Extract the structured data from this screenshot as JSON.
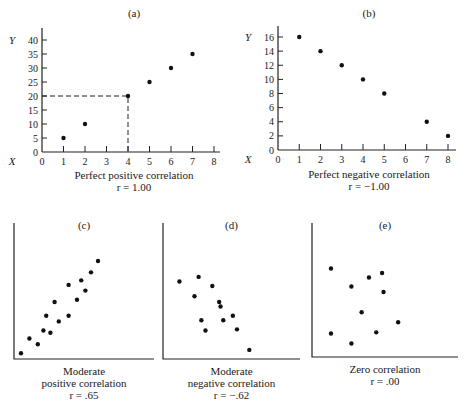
{
  "chart_data": [
    {
      "id": "a",
      "type": "scatter",
      "title": "(a)",
      "caption": "Perfect positive correlation",
      "r_label": "r = 1.00",
      "xlabel": "X",
      "ylabel": "Y",
      "xlim": [
        0,
        8
      ],
      "ylim": [
        0,
        40
      ],
      "xticks": [
        0,
        1,
        2,
        3,
        4,
        5,
        6,
        7,
        8
      ],
      "yticks": [
        0,
        5,
        10,
        15,
        20,
        25,
        30,
        35,
        40
      ],
      "x": [
        1,
        2,
        4,
        5,
        6,
        7
      ],
      "y": [
        5,
        10,
        20,
        25,
        30,
        35
      ],
      "annotation": {
        "type": "dashed-guide",
        "x": 4,
        "y": 20
      }
    },
    {
      "id": "b",
      "type": "scatter",
      "title": "(b)",
      "caption": "Perfect negative correlation",
      "r_label": "r = −1.00",
      "xlabel": "X",
      "ylabel": "Y",
      "xlim": [
        0,
        8
      ],
      "ylim": [
        0,
        16
      ],
      "xticks": [
        0,
        1,
        2,
        3,
        4,
        5,
        6,
        7,
        8
      ],
      "yticks": [
        0,
        2,
        4,
        6,
        8,
        10,
        12,
        14,
        16
      ],
      "x": [
        1,
        2,
        3,
        4,
        5,
        7,
        8
      ],
      "y": [
        16,
        14,
        12,
        10,
        8,
        4,
        2
      ]
    },
    {
      "id": "c",
      "type": "scatter",
      "title": "(c)",
      "caption": [
        "Moderate",
        "positive correlation"
      ],
      "r_label": "r = .65",
      "xlim": [
        0,
        10
      ],
      "ylim": [
        0,
        10
      ],
      "x": [
        0.5,
        1.1,
        1.7,
        2.1,
        2.6,
        2.3,
        3.2,
        2.9,
        3.9,
        3.9,
        4.5,
        4.8,
        5.1,
        5.5,
        6.0
      ],
      "y": [
        0.5,
        1.8,
        1.3,
        2.5,
        2.3,
        3.8,
        3.3,
        5.0,
        3.8,
        6.5,
        5.2,
        6.9,
        6.0,
        7.6,
        8.6
      ]
    },
    {
      "id": "d",
      "type": "scatter",
      "title": "(d)",
      "caption": [
        "Moderate",
        "negative correlation"
      ],
      "r_label": "r = −.62",
      "xlim": [
        0,
        10
      ],
      "ylim": [
        0,
        10
      ],
      "x": [
        1.2,
        2.3,
        2.8,
        3.1,
        3.6,
        4.1,
        4.2,
        4.4,
        5.1,
        5.4,
        6.3
      ],
      "y": [
        6.8,
        5.5,
        3.4,
        2.5,
        6.4,
        5.0,
        4.6,
        3.4,
        3.8,
        2.6,
        0.8
      ],
      "x_extra": [],
      "note": "point at (2.6,7.2) included below"
    },
    {
      "id": "e",
      "type": "scatter",
      "title": "(e)",
      "caption": [
        "Zero correlation"
      ],
      "r_label": "r = .00",
      "xlim": [
        0,
        10
      ],
      "ylim": [
        0,
        10
      ],
      "x": [
        1.3,
        1.3,
        2.7,
        2.7,
        3.4,
        3.9,
        4.4,
        4.8,
        4.9,
        5.9
      ],
      "y": [
        7.9,
        2.1,
        6.3,
        1.2,
        4.0,
        7.1,
        2.2,
        7.5,
        5.8,
        3.1
      ]
    }
  ]
}
